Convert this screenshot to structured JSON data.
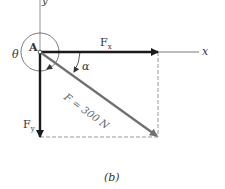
{
  "figure": {
    "caption": "(b)",
    "labels": {
      "y_axis": "y",
      "x_axis": "x",
      "point": "A",
      "theta": "θ",
      "alpha": "α",
      "fx": "F",
      "fx_sub": "x",
      "fy": "F",
      "fy_sub": "y",
      "force": "F = 300 N"
    },
    "colors": {
      "component_arrow": "#1a1a1a",
      "resultant_arrow": "#707070",
      "dashed": "#9a9a9a",
      "axis": "#555555"
    }
  }
}
